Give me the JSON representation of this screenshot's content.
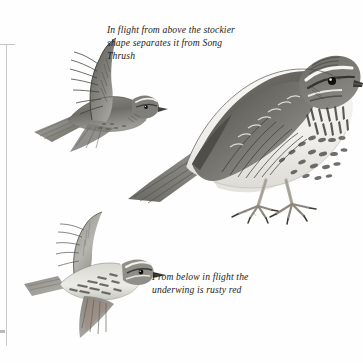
{
  "plate": {
    "subject": "Redwing",
    "medium": "field-guide illustration",
    "background_color": "#ffffff",
    "ink_color": "#1d1b19"
  },
  "captions": {
    "above": "In flight from above the stockier shape separates it from Song Thrush",
    "below": "From below in flight the underwing is rusty red"
  },
  "figures": {
    "standing": {
      "label": "standing-redwing",
      "pose": "perched, side view facing right",
      "features": "white supercilium, dark eyestripe, streaked breast, spotted flanks, pale legs"
    },
    "flight_above": {
      "label": "redwing-in-flight-from-above",
      "pose": "flying left, upperwing raised"
    },
    "flight_below": {
      "label": "redwing-in-flight-from-below",
      "pose": "flying right, underwing visible"
    }
  },
  "palette": {
    "feather_dark": "#4a4a48",
    "feather_mid": "#7d7d79",
    "feather_light": "#b4b3ae",
    "belly_white": "#f6f5f2",
    "leg_flesh": "#d9d5cc",
    "rule_gray": "#c9c9c9",
    "underwing_rusty": "#a08274"
  }
}
